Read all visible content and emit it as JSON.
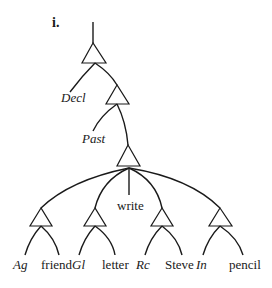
{
  "figure": {
    "label": "i.",
    "nodes": {
      "root_mood": "Decl",
      "tense": "Past",
      "verb": "write",
      "arguments": [
        {
          "case": "Ag",
          "noun": "friend"
        },
        {
          "case": "Gl",
          "noun": "letter"
        },
        {
          "case": "Rc",
          "noun": "Steve"
        },
        {
          "case": "In",
          "noun": "pencil"
        }
      ]
    },
    "colors": {
      "ink": "#1a1a1a",
      "background": "#ffffff"
    }
  }
}
